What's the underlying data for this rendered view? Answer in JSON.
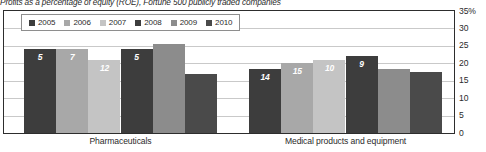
{
  "chart_data": {
    "type": "bar",
    "title": "Profits as a percentage of equity (ROE), Fortune 500 publicly traded companies",
    "xlabel": "",
    "ylabel": "",
    "ylim": [
      0,
      35
    ],
    "grid": true,
    "legend_position": "top-left",
    "categories": [
      "Pharmaceuticals",
      "Medical products and equipment"
    ],
    "yticks": [
      "35%",
      "30",
      "25",
      "20",
      "15",
      "10",
      "5",
      "0"
    ],
    "ytick_values": [
      35,
      30,
      25,
      20,
      15,
      10,
      5,
      0
    ],
    "series": [
      {
        "name": "2005",
        "color": "#3d3d3d",
        "values": [
          24,
          18.5
        ]
      },
      {
        "name": "2006",
        "color": "#a8a8a8",
        "values": [
          24,
          20
        ]
      },
      {
        "name": "2007",
        "color": "#c4c4c4",
        "values": [
          21,
          21
        ]
      },
      {
        "name": "2008",
        "color": "#3d3d3d",
        "values": [
          24,
          22
        ]
      },
      {
        "name": "2009",
        "color": "#8c8c8c",
        "values": [
          25.5,
          18.5
        ]
      },
      {
        "name": "2010",
        "color": "#4a4a4a",
        "values": [
          17,
          17.5
        ]
      }
    ],
    "data_labels": [
      [
        "5",
        "7",
        "12",
        "5",
        "",
        ""
      ],
      [
        "14",
        "15",
        "10",
        "9",
        "",
        ""
      ]
    ],
    "annotations": "Numbers inside bars are industry rank by return on equity"
  },
  "colors": {
    "frame": "#2d2d2d",
    "grid": "#c9c9c9",
    "text": "#2b2b2b",
    "label_text": "#ffffff",
    "background": "#ffffff"
  }
}
